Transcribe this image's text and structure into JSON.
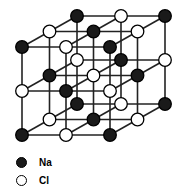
{
  "diagram": {
    "type": "crystal-lattice",
    "grid_size": 3,
    "colors": {
      "na_fill": "#1a1a1a",
      "cl_fill": "#ffffff",
      "stroke": "#000000",
      "bond": "#222222"
    }
  },
  "legend": {
    "items": [
      {
        "label": "Na",
        "style": "filled-black"
      },
      {
        "label": "Cl",
        "style": "open-white"
      }
    ]
  }
}
